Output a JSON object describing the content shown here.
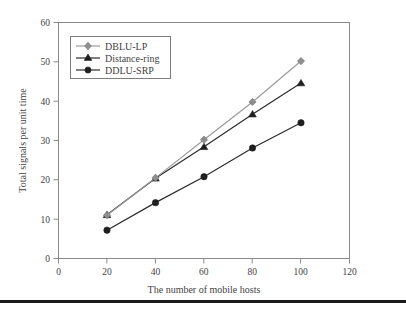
{
  "chart_data": {
    "type": "line",
    "title": "",
    "xlabel": "The number of mobile hosts",
    "ylabel": "Total signals per unit time",
    "x": [
      20,
      40,
      60,
      80,
      100
    ],
    "xlim": [
      0,
      120
    ],
    "ylim": [
      0,
      60
    ],
    "xticks": [
      0,
      20,
      40,
      60,
      80,
      100,
      120
    ],
    "yticks": [
      0,
      10,
      20,
      30,
      40,
      50,
      60
    ],
    "grid": false,
    "legend_position": "top-left-inside",
    "series": [
      {
        "name": "DBLU-LP",
        "values": [
          11.0,
          20.5,
          30.2,
          39.8,
          50.2
        ],
        "color": "#9a9a9a",
        "marker": "diamond"
      },
      {
        "name": "Distance-ring",
        "values": [
          11.1,
          20.4,
          28.4,
          36.7,
          44.6
        ],
        "color": "#2b2b2b",
        "marker": "triangle"
      },
      {
        "name": "DDLU-SRP",
        "values": [
          7.2,
          14.2,
          20.8,
          28.1,
          34.5
        ],
        "color": "#2b2b2b",
        "marker": "circle"
      }
    ]
  },
  "axes": {
    "x_tick_labels": [
      "0",
      "20",
      "40",
      "60",
      "80",
      "100",
      "120"
    ],
    "y_tick_labels": [
      "0",
      "10",
      "20",
      "30",
      "40",
      "50",
      "60"
    ],
    "x_title": "The number of mobile hosts",
    "y_title": "Total signals per unit time"
  },
  "legend": {
    "items": [
      {
        "label": "DBLU-LP"
      },
      {
        "label": "Distance-ring"
      },
      {
        "label": "DDLU-SRP"
      }
    ]
  },
  "colors": {
    "series_light": "#9a9a9a",
    "series_dark": "#2b2b2b",
    "frame": "#8a8a8a",
    "text": "#3f3f3f",
    "rule": "#1a1a1a",
    "background": "#ffffff"
  }
}
